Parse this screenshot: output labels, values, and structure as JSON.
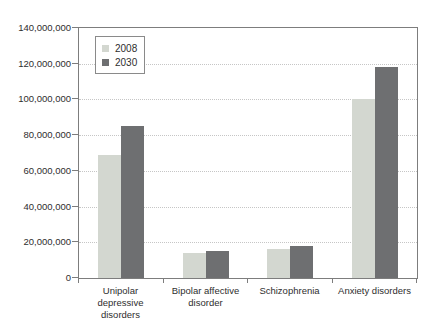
{
  "chart_data": {
    "type": "bar",
    "title": "",
    "xlabel": "",
    "ylabel": "",
    "categories": [
      "Unipolar depressive disorders",
      "Bipolar affective disorder",
      "Schizophrenia",
      "Anxiety disorders"
    ],
    "category_label_lines": [
      [
        "Unipolar",
        "depressive",
        "disorders"
      ],
      [
        "Bipolar affective",
        "disorder"
      ],
      [
        "Schizophrenia"
      ],
      [
        "Anxiety disorders"
      ]
    ],
    "series": [
      {
        "name": "2008",
        "color": "#d3d7d0",
        "values": [
          69000000,
          14000000,
          16000000,
          100000000
        ]
      },
      {
        "name": "2030",
        "color": "#6e6f71",
        "values": [
          85000000,
          15000000,
          18000000,
          118000000
        ]
      }
    ],
    "ylim": [
      0,
      140000000
    ],
    "ytick_step": 20000000,
    "ytick_labels": [
      "0",
      "20,000,000",
      "40,000,000",
      "60,000,000",
      "80,000,000",
      "100,000,000",
      "120,000,000",
      "140,000,000"
    ],
    "grid": "horizontal-dotted",
    "legend_position": "upper-left"
  },
  "colors": {
    "axis": "#7d7d7d",
    "gridline": "#c6c6c6",
    "text": "#2e2e2e",
    "background": "#ffffff",
    "series_2008": "#d3d7d0",
    "series_2030": "#6e6f71"
  }
}
